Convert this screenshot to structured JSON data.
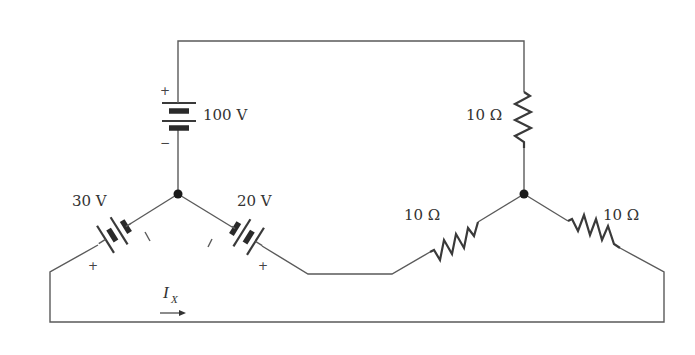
{
  "diagram": {
    "type": "circuit-schematic",
    "line_color": "#5a5a5a",
    "component_color": "#3a3a3a",
    "nodes": [
      {
        "id": "left-junction",
        "x": 178,
        "y": 194
      },
      {
        "id": "right-junction",
        "x": 524,
        "y": 194
      }
    ],
    "sources": [
      {
        "id": "battery-top",
        "label": "100 V",
        "plus_sign": "+",
        "minus_sign": "−"
      },
      {
        "id": "battery-left",
        "label": "30 V",
        "plus_sign": "+",
        "minus_sign": "−"
      },
      {
        "id": "battery-middle",
        "label": "20 V",
        "plus_sign": "+",
        "minus_sign": "−"
      }
    ],
    "resistors": [
      {
        "id": "resistor-top-right",
        "label": "10 Ω"
      },
      {
        "id": "resistor-middle",
        "label": "10 Ω"
      },
      {
        "id": "resistor-right",
        "label": "10 Ω"
      }
    ],
    "current": {
      "symbol": "I",
      "subscript": "X",
      "direction": "right"
    }
  }
}
